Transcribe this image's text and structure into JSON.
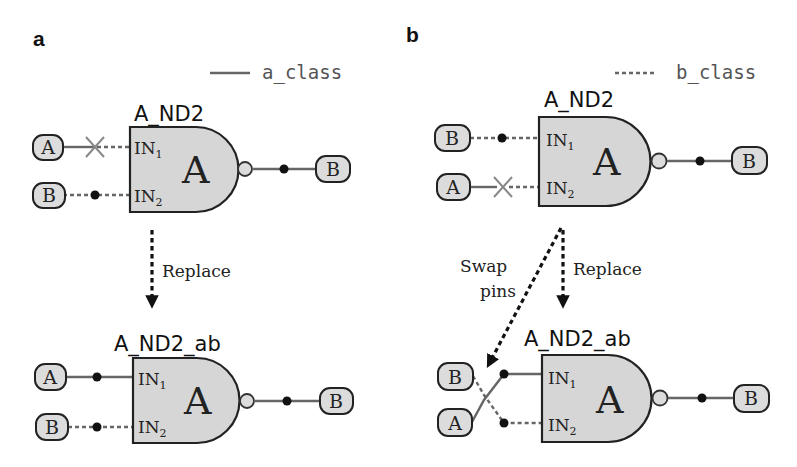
{
  "panels": [
    {
      "id": "a",
      "label": "a",
      "legend": {
        "style": "solid",
        "text": "a_class"
      },
      "before": {
        "cell_name": "A_ND2",
        "gate_letter": "A",
        "pins": [
          {
            "name": "IN",
            "sub": "1",
            "net": "A",
            "wire": "a_class",
            "broken": true
          },
          {
            "name": "IN",
            "sub": "2",
            "net": "B",
            "wire": "b_class",
            "broken": false
          }
        ],
        "output_net": "B"
      },
      "arrows": [
        {
          "label": "Replace"
        }
      ],
      "after": {
        "cell_name": "A_ND2_ab",
        "gate_letter": "A",
        "pins": [
          {
            "name": "IN",
            "sub": "1",
            "net": "A",
            "wire": "a_class"
          },
          {
            "name": "IN",
            "sub": "2",
            "net": "B",
            "wire": "b_class"
          }
        ],
        "output_net": "B"
      }
    },
    {
      "id": "b",
      "label": "b",
      "legend": {
        "style": "dashed",
        "text": "b_class"
      },
      "before": {
        "cell_name": "A_ND2",
        "gate_letter": "A",
        "pins": [
          {
            "name": "IN",
            "sub": "1",
            "net": "B",
            "wire": "b_class",
            "broken": false
          },
          {
            "name": "IN",
            "sub": "2",
            "net": "A",
            "wire": "a_class",
            "broken": true
          }
        ],
        "output_net": "B"
      },
      "arrows": [
        {
          "label_line1": "Swap",
          "label_line2": "pins"
        },
        {
          "label": "Replace"
        }
      ],
      "after": {
        "cell_name": "A_ND2_ab",
        "gate_letter": "A",
        "pins": [
          {
            "name": "IN",
            "sub": "1",
            "net": "B",
            "wire": "a_class"
          },
          {
            "name": "IN",
            "sub": "2",
            "net": "A",
            "wire": "b_class"
          }
        ],
        "output_net": "B"
      }
    }
  ]
}
